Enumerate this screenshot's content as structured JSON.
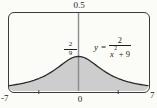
{
  "chart_data": {
    "type": "area",
    "function": "y = 2/(x^2 + 9)",
    "params": {
      "numerator": 2,
      "x_power": 2,
      "x_constant": 9
    },
    "x_range": [
      -7,
      7
    ],
    "y_range": [
      0,
      0.5
    ],
    "sample_step": 0.25,
    "x_tick_positions": [
      -4,
      4
    ],
    "x_axis_labels": {
      "left": "-7",
      "zero": "0",
      "right": "7"
    },
    "y_top_label": "0.5",
    "peak": {
      "x": 0,
      "y": 0.2222,
      "label_num": "2",
      "label_den": "9"
    },
    "endpoints": [
      {
        "x": -7,
        "y": 0.0345
      },
      {
        "x": 7,
        "y": 0.0345
      }
    ],
    "shaded_region": "area between curve and y=0 from x=-7 to x=7",
    "grid": false,
    "legend": false
  },
  "equation": {
    "var": "y",
    "rel": "=",
    "num": "2",
    "den_base": "x",
    "den_sup": "2",
    "den_rest": " + 9"
  },
  "colors": {
    "curve": "#2b2b2b",
    "fill": "#cdcdcd",
    "axis": "#8c8c8c",
    "border": "#3a3a3a",
    "tick": "#4a4a4a",
    "text": "#1d1d1d",
    "background": "#fbfbf8"
  }
}
